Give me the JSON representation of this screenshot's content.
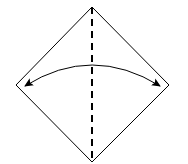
{
  "diagram": {
    "type": "origami-fold-step",
    "canvas": {
      "width": 188,
      "height": 164
    },
    "colors": {
      "background": "#ffffff",
      "stroke": "#000000"
    },
    "paper": {
      "shape": "diamond",
      "vertices": {
        "top": [
          92,
          7
        ],
        "right": [
          169,
          85
        ],
        "bottom": [
          92,
          162
        ],
        "left": [
          16,
          85
        ]
      },
      "stroke_width": 1
    },
    "fold_line": {
      "style": "valley-dashed",
      "from": [
        92,
        7
      ],
      "to": [
        92,
        162
      ],
      "stroke_width": 2,
      "dash": [
        7,
        5
      ]
    },
    "arrow": {
      "type": "double-headed-curved",
      "start": [
        25,
        86
      ],
      "control": [
        92,
        44
      ],
      "end": [
        160,
        86
      ],
      "stroke_width": 1
    }
  }
}
